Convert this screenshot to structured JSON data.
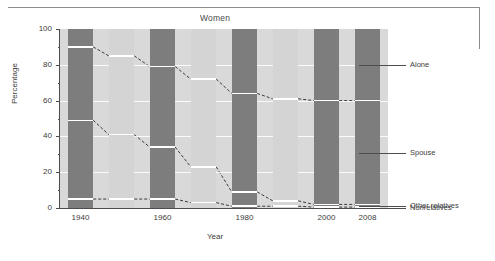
{
  "chart_data": {
    "type": "bar",
    "subtype": "100% stacked bar",
    "title": "Women",
    "xlabel": "Year",
    "ylabel": "Percentage",
    "ylim": [
      0,
      100
    ],
    "yticks": [
      0,
      20,
      40,
      60,
      80,
      100
    ],
    "grid": true,
    "legend_position": "right",
    "categories": [
      "1940",
      "1945",
      "1950",
      "1955",
      "1960",
      "1965",
      "1970",
      "1975",
      "1980",
      "1985",
      "1990",
      "1995",
      "2000",
      "2005",
      "2008"
    ],
    "tick_categories": [
      "1940",
      "1960",
      "1980",
      "2000",
      "2008"
    ],
    "series": [
      {
        "name": "Alone",
        "color": "#7d7d7d",
        "values": [
          10,
          12,
          15,
          18,
          21,
          24,
          28,
          32,
          36,
          38,
          39,
          40,
          40,
          40,
          40
        ]
      },
      {
        "name": "Spouse",
        "color": "#d4d4d4",
        "values": [
          41,
          42,
          44,
          45,
          45,
          47,
          49,
          51,
          55,
          56,
          57,
          58,
          58,
          58,
          58
        ]
      },
      {
        "name": "Other relatives",
        "color": "#7d7d7d",
        "values": [
          44,
          41,
          36,
          32,
          29,
          25,
          20,
          15,
          8,
          5,
          3,
          1.5,
          1.5,
          1.5,
          1.5
        ]
      },
      {
        "name": "Nonrelatives",
        "color": "#d4d4d4",
        "values": [
          5,
          5,
          5,
          5,
          5,
          4,
          3,
          2,
          1,
          1,
          1,
          0.5,
          0.5,
          0.5,
          0.5
        ]
      }
    ]
  },
  "bars": [
    {
      "label": "1940",
      "tick": true,
      "shade": "dark",
      "alone": 10,
      "spouse": 41,
      "other": 44,
      "nonrel": 5
    },
    {
      "label": "1950",
      "tick": false,
      "shade": "light",
      "alone": 15,
      "spouse": 44,
      "other": 36,
      "nonrel": 5
    },
    {
      "label": "1960",
      "tick": true,
      "shade": "dark",
      "alone": 21,
      "spouse": 45,
      "other": 29,
      "nonrel": 5
    },
    {
      "label": "1970",
      "tick": false,
      "shade": "light",
      "alone": 28,
      "spouse": 49,
      "other": 20,
      "nonrel": 3
    },
    {
      "label": "1980",
      "tick": true,
      "shade": "dark",
      "alone": 36,
      "spouse": 55,
      "other": 8,
      "nonrel": 1
    },
    {
      "label": "1990",
      "tick": false,
      "shade": "light",
      "alone": 39,
      "spouse": 57,
      "other": 3,
      "nonrel": 1
    },
    {
      "label": "2000",
      "tick": true,
      "shade": "dark",
      "alone": 40,
      "spouse": 58,
      "other": 1.5,
      "nonrel": 0.5
    },
    {
      "label": "2008",
      "tick": true,
      "shade": "dark",
      "alone": 40,
      "spouse": 58,
      "other": 1.5,
      "nonrel": 0.5
    }
  ],
  "axes": {
    "y_title": "Percentage",
    "x_title": "Year",
    "y_ticks": [
      "100",
      "80",
      "60",
      "40",
      "20",
      "0"
    ],
    "x_ticks": [
      "1940",
      "1960",
      "1980",
      "2000",
      "2008"
    ]
  },
  "legend": {
    "items": [
      {
        "label": "Alone"
      },
      {
        "label": "Spouse"
      },
      {
        "label": "Other relatives"
      },
      {
        "label": "Nonrelatives"
      }
    ]
  }
}
